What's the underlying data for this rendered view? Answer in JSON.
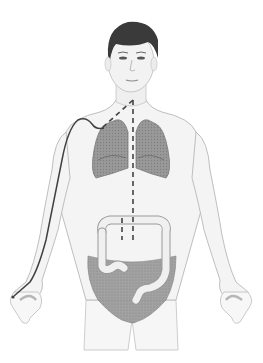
{
  "figure": {
    "elements": [
      "head",
      "torso",
      "arms",
      "lungs",
      "colon",
      "pelvis",
      "catheter-line",
      "dashed-pathway"
    ],
    "colors": {
      "background": "#ffffff",
      "skin": "#f4f4f4",
      "outline": "#9a9a9a",
      "hair": "#3a3a3a",
      "organ": "#8c8c8c",
      "pelvis": "#a0a0a0",
      "line": "#444444"
    }
  }
}
